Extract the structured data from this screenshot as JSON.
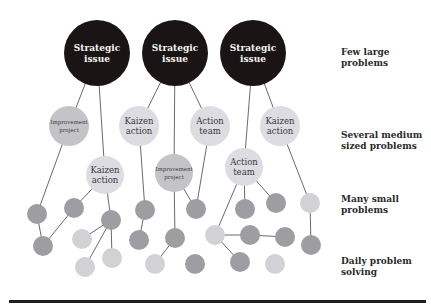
{
  "diagram": {
    "colors": {
      "strategic": "#1a1414",
      "medium": "#dcdce2",
      "medium_dark": "#c4c4c8",
      "small_dark": "#9e9ea2",
      "small_light": "#d2d2d6",
      "line": "#6a6a6a"
    },
    "levels": [
      {
        "label": "Few large\nproblems",
        "x": 341,
        "y": 47
      },
      {
        "label": "Several medium\nsized problems",
        "x": 341,
        "y": 130
      },
      {
        "label": "Many small\nproblems",
        "x": 341,
        "y": 194
      },
      {
        "label": "Daily problem\nsolving",
        "x": 341,
        "y": 256
      }
    ],
    "strategic_nodes": [
      {
        "id": "s1",
        "label": "Strategic\nissue",
        "cx": 97,
        "cy": 53,
        "r": 33
      },
      {
        "id": "s2",
        "label": "Strategic\nissue",
        "cx": 175,
        "cy": 53,
        "r": 33
      },
      {
        "id": "s3",
        "label": "Strategic\nissue",
        "cx": 253,
        "cy": 53,
        "r": 33
      }
    ],
    "medium_nodes": [
      {
        "id": "m1",
        "label": "Improvement\nproject",
        "cx": 69,
        "cy": 126,
        "r": 20,
        "tone": "dark",
        "small_text": true
      },
      {
        "id": "m2",
        "label": "Kaizen\naction",
        "cx": 139,
        "cy": 126,
        "r": 20,
        "tone": "light"
      },
      {
        "id": "m3",
        "label": "Action\nteam",
        "cx": 210,
        "cy": 126,
        "r": 20,
        "tone": "light"
      },
      {
        "id": "m4",
        "label": "Kaizen\naction",
        "cx": 280,
        "cy": 126,
        "r": 20,
        "tone": "light"
      },
      {
        "id": "m5",
        "label": "Kaizen\naction",
        "cx": 105,
        "cy": 175,
        "r": 19,
        "tone": "light"
      },
      {
        "id": "m6",
        "label": "Improvement\nproject",
        "cx": 174,
        "cy": 173,
        "r": 19,
        "tone": "dark",
        "small_text": true
      },
      {
        "id": "m7",
        "label": "Action\nteam",
        "cx": 244,
        "cy": 167,
        "r": 19,
        "tone": "light"
      }
    ],
    "small_nodes": [
      {
        "id": "a1",
        "cx": 37,
        "cy": 214,
        "tone": "dark"
      },
      {
        "id": "a2",
        "cx": 74,
        "cy": 208,
        "tone": "dark"
      },
      {
        "id": "a3",
        "cx": 43,
        "cy": 246,
        "tone": "dark"
      },
      {
        "id": "a4",
        "cx": 111,
        "cy": 220,
        "tone": "dark"
      },
      {
        "id": "a5",
        "cx": 82,
        "cy": 239,
        "tone": "light"
      },
      {
        "id": "a6",
        "cx": 85,
        "cy": 267,
        "tone": "light"
      },
      {
        "id": "a7",
        "cx": 112,
        "cy": 258,
        "tone": "light"
      },
      {
        "id": "a8",
        "cx": 145,
        "cy": 210,
        "tone": "dark"
      },
      {
        "id": "a9",
        "cx": 139,
        "cy": 240,
        "tone": "dark"
      },
      {
        "id": "a10",
        "cx": 175,
        "cy": 238,
        "tone": "dark"
      },
      {
        "id": "a11",
        "cx": 196,
        "cy": 209,
        "tone": "dark"
      },
      {
        "id": "a12",
        "cx": 155,
        "cy": 264,
        "tone": "light"
      },
      {
        "id": "a13",
        "cx": 195,
        "cy": 264,
        "tone": "dark"
      },
      {
        "id": "a14",
        "cx": 215,
        "cy": 235,
        "tone": "light"
      },
      {
        "id": "a15",
        "cx": 245,
        "cy": 209,
        "tone": "dark"
      },
      {
        "id": "a16",
        "cx": 250,
        "cy": 235,
        "tone": "dark"
      },
      {
        "id": "a17",
        "cx": 276,
        "cy": 203,
        "tone": "dark"
      },
      {
        "id": "a18",
        "cx": 285,
        "cy": 237,
        "tone": "dark"
      },
      {
        "id": "a19",
        "cx": 310,
        "cy": 203,
        "tone": "light"
      },
      {
        "id": "a20",
        "cx": 240,
        "cy": 262,
        "tone": "dark"
      },
      {
        "id": "a21",
        "cx": 275,
        "cy": 264,
        "tone": "light"
      },
      {
        "id": "a22",
        "cx": 311,
        "cy": 245,
        "tone": "dark"
      }
    ],
    "edges": [
      [
        "s1",
        "m1"
      ],
      [
        "s1",
        "m5"
      ],
      [
        "s2",
        "m2"
      ],
      [
        "s2",
        "m6"
      ],
      [
        "s2",
        "m3"
      ],
      [
        "s3",
        "m7"
      ],
      [
        "s3",
        "m4"
      ],
      [
        "m1",
        "a1"
      ],
      [
        "a1",
        "a3"
      ],
      [
        "a3",
        "a2"
      ],
      [
        "a2",
        "m5"
      ],
      [
        "m5",
        "a4"
      ],
      [
        "a4",
        "a5"
      ],
      [
        "a4",
        "a6"
      ],
      [
        "a4",
        "a7"
      ],
      [
        "m2",
        "a8"
      ],
      [
        "a8",
        "a9"
      ],
      [
        "m6",
        "a10"
      ],
      [
        "a10",
        "a12"
      ],
      [
        "m6",
        "a11"
      ],
      [
        "m3",
        "a11"
      ],
      [
        "m7",
        "a14"
      ],
      [
        "m7",
        "a15"
      ],
      [
        "m7",
        "a17"
      ],
      [
        "a14",
        "a16"
      ],
      [
        "a16",
        "a18"
      ],
      [
        "a14",
        "a20"
      ],
      [
        "m4",
        "a19"
      ],
      [
        "a19",
        "a22"
      ]
    ],
    "small_radius": 10
  }
}
